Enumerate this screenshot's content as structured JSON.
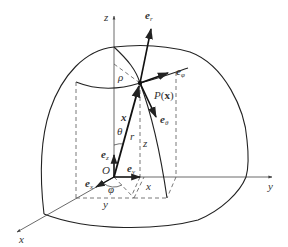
{
  "diagram": {
    "axes": {
      "x": "x",
      "y": "y",
      "z": "z"
    },
    "origin": "O",
    "point": {
      "label": "P(x)",
      "name": "P",
      "arg": "x"
    },
    "basis_vectors": {
      "e_r": {
        "base": "e",
        "sub": "r"
      },
      "e_phi": {
        "base": "e",
        "sub": "φ"
      },
      "e_theta": {
        "base": "e",
        "sub": "θ"
      },
      "e_x": {
        "base": "e",
        "sub": "x"
      },
      "e_y": {
        "base": "e",
        "sub": "y"
      },
      "e_z": {
        "base": "e",
        "sub": "z"
      }
    },
    "labels": {
      "rho": "ρ",
      "theta": "θ",
      "phi": "φ",
      "r": "r",
      "position_vector": "x",
      "z_coord": "z",
      "x_coord": "x",
      "y_coord": "y"
    },
    "colors": {
      "line": "#222222",
      "dashed": "#555555",
      "background": "#ffffff"
    }
  }
}
